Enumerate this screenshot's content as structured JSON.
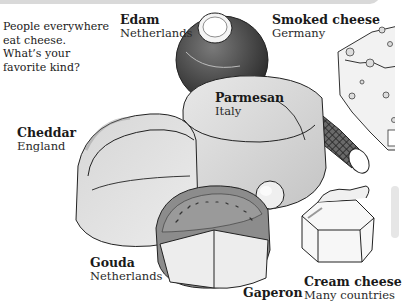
{
  "intro": {
    "lines": [
      "People everywhere",
      "eat cheese.",
      "What’s your",
      "favorite kind?"
    ]
  },
  "cheeses": [
    {
      "name": "Edam",
      "country": "Netherlands"
    },
    {
      "name": "Smoked cheese",
      "country": "Germany"
    },
    {
      "name": "Parmesan",
      "country": "Italy"
    },
    {
      "name": "Cheddar",
      "country": "England"
    },
    {
      "name": "Gouda",
      "country": "Netherlands"
    },
    {
      "name": "Gaperon",
      "country": ""
    },
    {
      "name": "Cream cheese",
      "country": "Many countries"
    }
  ],
  "colors": {
    "topbar": "#d9d9d9",
    "ink": "#1a1a1a",
    "edam_rind": "#4a4a4a",
    "gouda_rind": "#8a8a8a",
    "cheese_light": "#e4e4e4",
    "cheese_mid": "#cfcfcf"
  }
}
